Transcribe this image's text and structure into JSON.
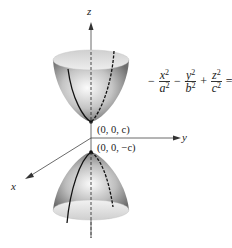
{
  "figure": {
    "axes": {
      "x_label": "x",
      "y_label": "y",
      "z_label": "z"
    },
    "points": {
      "upper_vertex": "(0, 0, c)",
      "lower_vertex": "(0, 0, −c)"
    },
    "equation": {
      "lead_sign": "−",
      "term1_num": "x",
      "term1_den": "a",
      "op1": "−",
      "term2_num": "y",
      "term2_den": "b",
      "op2": "+",
      "term3_num": "z",
      "term3_den": "c",
      "exp": "2",
      "equals": "=",
      "rhs": "1"
    },
    "colors": {
      "surface_light": "#f2f2f2",
      "surface_dark": "#7a7a7a",
      "rim": "#d9d9d9",
      "line": "#111111",
      "axis": "#444444"
    }
  }
}
